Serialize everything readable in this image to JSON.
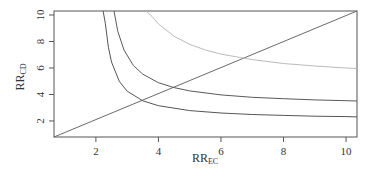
{
  "chart_data": {
    "type": "line",
    "title": "",
    "xlabel": "RR",
    "xlabel_sub": "EC",
    "ylabel": "RR",
    "ylabel_sub": "CD",
    "xlim": [
      0.66,
      10.35
    ],
    "ylim": [
      0.79,
      10.3
    ],
    "xticks": [
      2,
      4,
      6,
      8,
      10
    ],
    "yticks": [
      2,
      4,
      6,
      8,
      10
    ],
    "grid": false,
    "legend": null,
    "series": [
      {
        "name": "diagonal",
        "color": "#6a6a6a",
        "x": [
          0.66,
          10.35
        ],
        "y": [
          0.79,
          10.3
        ]
      },
      {
        "name": "curve-1",
        "color": "#555555",
        "x": [
          2.23,
          2.3,
          2.4,
          2.5,
          2.75,
          3.0,
          3.5,
          4.0,
          5.0,
          6.0,
          7.0,
          8.0,
          9.0,
          10.0,
          10.35
        ],
        "y": [
          10.3,
          9.38,
          7.55,
          6.45,
          4.98,
          4.25,
          3.52,
          3.15,
          2.78,
          2.6,
          2.49,
          2.42,
          2.36,
          2.33,
          2.31
        ]
      },
      {
        "name": "curve-2",
        "color": "#5a5a5a",
        "x": [
          2.58,
          2.7,
          2.9,
          3.2,
          3.5,
          4.0,
          4.5,
          5.0,
          6.0,
          7.0,
          8.0,
          9.0,
          10.0,
          10.35
        ],
        "y": [
          10.3,
          8.77,
          7.35,
          6.19,
          5.53,
          4.89,
          4.52,
          4.27,
          3.97,
          3.79,
          3.68,
          3.59,
          3.53,
          3.51
        ]
      },
      {
        "name": "curve-3",
        "color": "#bbbbbb",
        "x": [
          3.6,
          3.8,
          4.0,
          4.5,
          5.0,
          5.5,
          6.0,
          7.0,
          8.0,
          9.0,
          10.0,
          10.35
        ],
        "y": [
          10.3,
          9.88,
          9.33,
          8.39,
          7.79,
          7.36,
          7.05,
          6.63,
          6.34,
          6.15,
          6.0,
          5.96
        ]
      }
    ]
  }
}
